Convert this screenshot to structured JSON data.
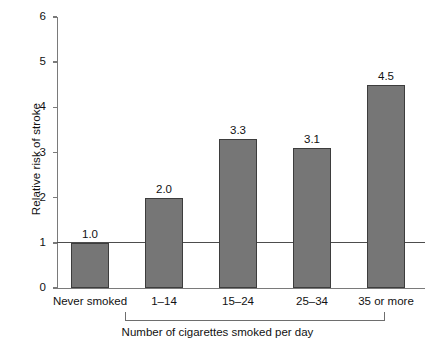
{
  "chart_data": {
    "type": "bar",
    "title": "",
    "xlabel": "Number of cigarettes smoked per day",
    "ylabel": "Relative risk of stroke",
    "categories": [
      "Never smoked",
      "1–14",
      "15–24",
      "25–34",
      "35 or more"
    ],
    "values": [
      1.0,
      2.0,
      3.3,
      3.1,
      4.5
    ],
    "value_labels": [
      "1.0",
      "2.0",
      "3.3",
      "3.1",
      "4.5"
    ],
    "ylim": [
      0,
      6
    ],
    "ytick_labels": [
      "0",
      "1",
      "2",
      "3",
      "4",
      "5",
      "6"
    ],
    "ytick_values": [
      0,
      1,
      2,
      3,
      4,
      5,
      6
    ],
    "grid": false,
    "legend": null,
    "reference_line": {
      "value": 1.0,
      "label": ""
    },
    "group_bracket": {
      "label": "Number of cigarettes smoked per day",
      "spans_categories": [
        "1–14",
        "15–24",
        "25–34",
        "35 or more"
      ]
    },
    "colors": {
      "bar_fill": "#767676",
      "bar_edge": "#3d3d3d",
      "axis": "#7a7a7a",
      "reference_line": "#4d4d4d",
      "background": "#ffffff",
      "text": "#111111"
    }
  }
}
